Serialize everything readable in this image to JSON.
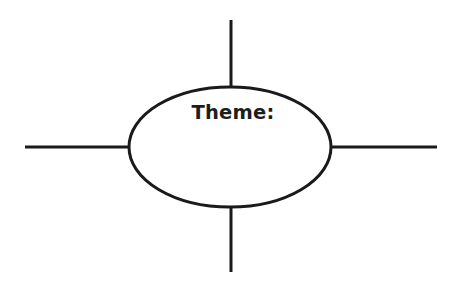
{
  "canvas": {
    "width": 454,
    "height": 281,
    "background_color": "#ffffff"
  },
  "diagram": {
    "type": "theme-web-organizer",
    "ink_color": "#1a1a1a",
    "center_node": {
      "shape": "ellipse",
      "label": "Theme:",
      "label_color": "#1d1d1d",
      "fill_color": "#ffffff",
      "stroke_color": "#1a1a1a",
      "stroke_width": 3,
      "center_x": 230,
      "center_y": 147,
      "radius_x": 101,
      "radius_y": 60,
      "label_x": 233,
      "label_y": 119
    },
    "spokes": [
      {
        "name": "top-spoke",
        "direction": "up",
        "label": "",
        "x1": 231,
        "y1": 20,
        "x2": 231,
        "y2": 88,
        "stroke_width": 3
      },
      {
        "name": "right-spoke",
        "direction": "right",
        "label": "",
        "x1": 331,
        "y1": 147,
        "x2": 437,
        "y2": 147,
        "stroke_width": 3
      },
      {
        "name": "bottom-spoke",
        "direction": "down",
        "label": "",
        "x1": 231,
        "y1": 207,
        "x2": 231,
        "y2": 272,
        "stroke_width": 3
      },
      {
        "name": "left-spoke",
        "direction": "left",
        "label": "",
        "x1": 25,
        "y1": 147,
        "x2": 130,
        "y2": 147,
        "stroke_width": 3
      }
    ]
  }
}
